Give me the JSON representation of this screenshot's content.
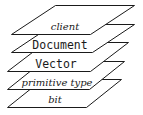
{
  "diagram": {
    "type": "layer-stack",
    "colors": {
      "background": "#ffffff",
      "stroke": "#1a1a1a",
      "text": "#1a1a1a"
    },
    "layers": [
      {
        "label": "client",
        "style": "serif-italic"
      },
      {
        "label": "Document",
        "style": "monospace"
      },
      {
        "label": "Vector",
        "style": "monospace"
      },
      {
        "label": "primitive type",
        "style": "serif-italic"
      },
      {
        "label": "bit",
        "style": "serif-italic"
      }
    ]
  }
}
